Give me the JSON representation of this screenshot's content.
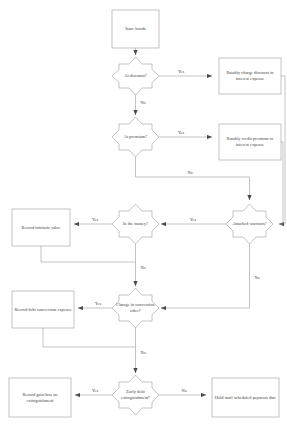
{
  "diagram": {
    "background_color": "#ffffff",
    "line_color": "#9a9a9a",
    "text_color": "#3d3d3d",
    "shape_fill": "#ffffff"
  },
  "nodes": {
    "issue_bonds": {
      "label": "Issue bonds",
      "type": "process"
    },
    "at_discount": {
      "label": "At discount?",
      "type": "decision"
    },
    "charge_discount": {
      "label": "Ratably charge discount to interest expense",
      "type": "process"
    },
    "at_premium": {
      "label": "At premium?",
      "type": "decision"
    },
    "credit_premium": {
      "label": "Ratably credit premium to interest expense",
      "type": "process"
    },
    "attached_warrants": {
      "label": "Attached warrants?",
      "type": "decision"
    },
    "in_the_money": {
      "label": "In the money?",
      "type": "decision"
    },
    "record_intrinsic": {
      "label": "Record intrinsic value",
      "type": "process"
    },
    "change_conversion": {
      "label": "Change in conversion offer?",
      "type": "decision"
    },
    "record_conversion_expense": {
      "label": "Record debt conversion expense",
      "type": "process"
    },
    "early_extinguishment": {
      "label": "Early debt extinguishment?",
      "type": "decision"
    },
    "record_gain_loss": {
      "label": "Record gain/loss on extinguishment",
      "type": "process"
    },
    "hold_until_scheduled": {
      "label": "Hold until scheduled payment date",
      "type": "process"
    }
  },
  "edge_labels": {
    "discount_yes": "Yes",
    "discount_no": "No",
    "premium_yes": "Yes",
    "premium_no": "No",
    "warrants_yes": "Yes",
    "warrants_no": "No",
    "money_yes": "Yes",
    "money_no": "No",
    "conversion_yes": "Yes",
    "conversion_no": "No",
    "extinguish_yes": "Yes",
    "extinguish_no": "No"
  }
}
